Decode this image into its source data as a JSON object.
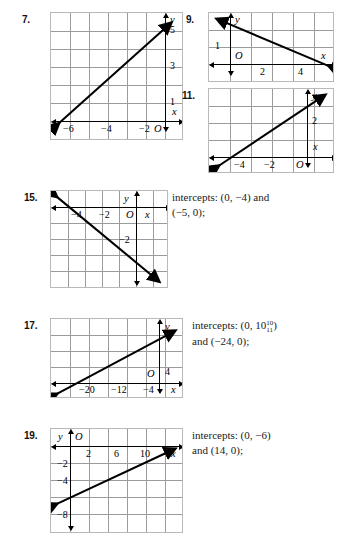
{
  "page": {
    "type": "textbook-answer-key-graphs",
    "background": "#ffffff"
  },
  "problems": [
    {
      "number": "7.",
      "grid": {
        "cols": 7,
        "rows": 7
      },
      "x_labels": [
        "−6",
        "−4",
        "−2",
        "O"
      ],
      "y_labels": [
        "1",
        "3",
        "5"
      ],
      "axis_labels": {
        "x": "x",
        "y": "y"
      },
      "line": {
        "direction": "ascending"
      },
      "answer": null
    },
    {
      "number": "9.",
      "grid": {
        "cols": 6,
        "rows": 4
      },
      "x_labels": [
        "2",
        "4"
      ],
      "y_labels": [
        "1"
      ],
      "origin_label": "O",
      "axis_labels": {
        "x": "x",
        "y": "y"
      },
      "line": {
        "direction": "descending"
      },
      "answer": null
    },
    {
      "number": "11.",
      "grid": {
        "cols": 6,
        "rows": 5
      },
      "x_labels": [
        "−4",
        "−2",
        "O"
      ],
      "y_labels": [
        "2"
      ],
      "axis_labels": {
        "x": "x",
        "y": "y"
      },
      "line": {
        "direction": "ascending"
      },
      "answer": null
    },
    {
      "number": "15.",
      "grid": {
        "cols": 7,
        "rows": 6
      },
      "x_labels": [
        "−4",
        "−2",
        "O"
      ],
      "y_labels": [
        "−2"
      ],
      "axis_labels": {
        "x": "x",
        "y": "y"
      },
      "line": {
        "direction": "descending"
      },
      "answer": {
        "line1": "intercepts: (0, −4) and",
        "line2": "(−5, 0);"
      }
    },
    {
      "number": "17.",
      "grid": {
        "cols": 7,
        "rows": 5
      },
      "x_labels": [
        "−20",
        "−12",
        "−4"
      ],
      "y_labels": [
        "4"
      ],
      "origin_label": "O",
      "axis_labels": {
        "x": "x",
        "y": "y"
      },
      "line": {
        "direction": "ascending"
      },
      "answer": {
        "prefix": "intercepts: (0, 10",
        "frac_num": "10",
        "frac_den": "11",
        "suffix": ")",
        "line2": "and (−24, 0);"
      }
    },
    {
      "number": "19.",
      "grid": {
        "cols": 7,
        "rows": 6
      },
      "x_labels": [
        "2",
        "6",
        "10"
      ],
      "y_labels": [
        "−2",
        "−4",
        "−8"
      ],
      "origin_label": "O",
      "axis_labels": {
        "x": "x",
        "y": "y"
      },
      "line": {
        "direction": "ascending"
      },
      "answer": {
        "line1": "intercepts: (0, −6)",
        "line2": "and (14, 0);"
      }
    }
  ],
  "colors": {
    "grid_line": "#9b9b9b",
    "graph_border": "#b9b9b9",
    "axis": "#000000",
    "plot_line": "#000000",
    "text": "#1a1a1a"
  }
}
